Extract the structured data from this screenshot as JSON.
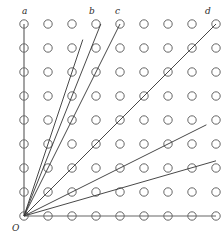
{
  "figure": {
    "kind": "lattice-ray-diagram",
    "background_color": "#ffffff",
    "origin_label": "O",
    "grid": {
      "columns": 9,
      "rows": 9,
      "spacing_px": 24,
      "origin_x_px": 24,
      "origin_y_px": 216,
      "dot_radius_px": 4.2,
      "dot_stroke_color": "#555555",
      "dot_stroke_width": 0.9,
      "dot_fill": "none"
    },
    "axes": {
      "color": "#666666",
      "width": 1.2,
      "x_axis_from": [
        0,
        0
      ],
      "x_axis_to": [
        8,
        0
      ],
      "y_axis_from": [
        0,
        0
      ],
      "y_axis_to": [
        0,
        8
      ]
    },
    "rays": [
      {
        "name": "ray-a",
        "label": "a",
        "slope": "1/0",
        "dx": 0,
        "dy": 8,
        "through_label": true
      },
      {
        "name": "ray-b",
        "label": "b",
        "slope": "3/1",
        "dx": 2.45,
        "dy": 7.35,
        "through_label": false
      },
      {
        "name": "ray-c",
        "label": "c",
        "slope": "5/2",
        "dx": 3.2,
        "dy": 8,
        "through_label": true
      },
      {
        "name": "ray-d-steep",
        "label": "",
        "slope": "2/1",
        "dx": 4,
        "dy": 8,
        "through_label": false
      },
      {
        "name": "ray-d",
        "label": "d",
        "slope": "1/1",
        "dx": 8,
        "dy": 8,
        "through_label": true
      },
      {
        "name": "ray-e",
        "label": "",
        "slope": "1/2",
        "dx": 7.6,
        "dy": 3.8,
        "through_label": false
      },
      {
        "name": "ray-f",
        "label": "",
        "slope": "2/7",
        "dx": 8,
        "dy": 2.3,
        "through_label": false
      }
    ],
    "ray_style": {
      "color": "#333333",
      "width": 0.9
    },
    "labels": [
      {
        "name": "label-a",
        "text": "a",
        "x_px": 22,
        "y_px": 7
      },
      {
        "name": "label-b",
        "text": "b",
        "x_px": 89,
        "y_px": 7
      },
      {
        "name": "label-c",
        "text": "c",
        "x_px": 115,
        "y_px": 7
      },
      {
        "name": "label-d",
        "text": "d",
        "x_px": 205,
        "y_px": 7
      },
      {
        "name": "label-o",
        "text": "O",
        "x_px": 12,
        "y_px": 224
      }
    ]
  }
}
